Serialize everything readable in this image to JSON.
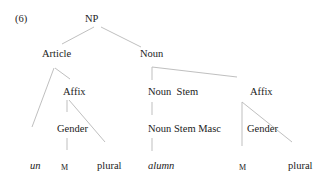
{
  "example_number": "(6)",
  "tree": {
    "root": "NP",
    "article": {
      "label": "Article",
      "affix": "Affix",
      "gender": "Gender",
      "leaves": {
        "word": "un",
        "gender_value": "M",
        "number": "plural"
      }
    },
    "noun": {
      "label": "Noun",
      "noun_stem": "Noun  Stem",
      "noun_stem_masc": "Noun Stem Masc",
      "stem_leaf": "alumn",
      "affix": "Affix",
      "gender": "Gender",
      "leaves": {
        "gender_value": "M",
        "number": "plural"
      }
    }
  },
  "colors": {
    "text": "#222222",
    "edges": "#b8b8b8",
    "background": "#ffffff"
  }
}
